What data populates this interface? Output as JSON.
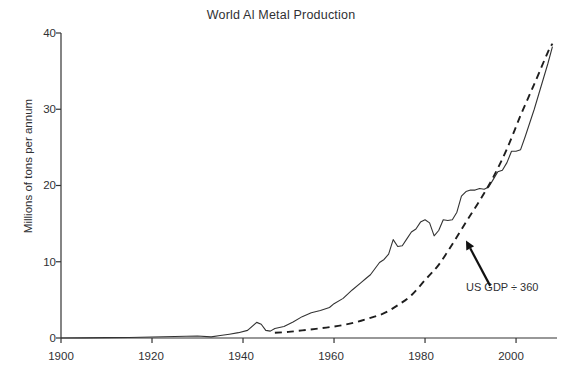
{
  "chart_data": {
    "type": "line",
    "title": "World Al Metal Production",
    "xlabel": "",
    "ylabel": "Millions of tons per annum",
    "xlim": [
      1900,
      2009
    ],
    "ylim": [
      0,
      40
    ],
    "xticks": [
      1900,
      1920,
      1940,
      1960,
      1980,
      2000
    ],
    "xtick_labels": [
      "1900",
      "1920",
      "1940",
      "1960",
      "1980",
      "2000"
    ],
    "yticks": [
      0,
      10,
      20,
      30,
      40
    ],
    "ytick_labels": [
      "0",
      "10",
      "20",
      "30",
      "40"
    ],
    "grid": false,
    "legend": "none",
    "annotations": [
      {
        "text": "US GDP ÷ 360",
        "points_to_series": "US GDP ÷ 360",
        "arrow_tip_year": 1989,
        "arrow_tip_value": 12.8,
        "label_year": 1993,
        "label_value": 7.1
      }
    ],
    "series": [
      {
        "name": "World Al metal production",
        "style": "solid",
        "color": "#333333",
        "x": [
          1900,
          1905,
          1910,
          1915,
          1920,
          1925,
          1930,
          1933,
          1935,
          1937,
          1939,
          1941,
          1943,
          1944,
          1945,
          1946,
          1947,
          1949,
          1951,
          1953,
          1955,
          1957,
          1959,
          1960,
          1962,
          1964,
          1966,
          1967,
          1968,
          1970,
          1971,
          1972,
          1973,
          1974,
          1975,
          1976,
          1977,
          1978,
          1979,
          1980,
          1981,
          1982,
          1983,
          1984,
          1985,
          1986,
          1987,
          1988,
          1989,
          1990,
          1991,
          1992,
          1993,
          1994,
          1995,
          1996,
          1997,
          1998,
          1999,
          2000,
          2001,
          2002,
          2003,
          2004,
          2005,
          2006,
          2007,
          2008
        ],
        "y": [
          0.007,
          0.01,
          0.045,
          0.07,
          0.13,
          0.19,
          0.27,
          0.15,
          0.32,
          0.5,
          0.7,
          1.0,
          2.05,
          1.8,
          1.0,
          0.9,
          1.25,
          1.5,
          2.1,
          2.8,
          3.3,
          3.6,
          4.0,
          4.5,
          5.2,
          6.3,
          7.3,
          7.8,
          8.3,
          9.9,
          10.3,
          11.0,
          12.9,
          12.0,
          12.1,
          13.0,
          13.9,
          14.3,
          15.2,
          15.5,
          15.1,
          13.4,
          14.1,
          15.5,
          15.4,
          15.5,
          16.5,
          18.6,
          19.2,
          19.4,
          19.4,
          19.6,
          19.5,
          19.8,
          20.8,
          21.8,
          22.0,
          23.0,
          24.5,
          24.5,
          24.7,
          26.4,
          28.2,
          30.0,
          32.0,
          34.0,
          36.0,
          38.2
        ]
      },
      {
        "name": "US GDP ÷ 360",
        "style": "dashed",
        "color": "#1e1e1e",
        "x": [
          1947,
          1950,
          1953,
          1956,
          1959,
          1962,
          1965,
          1968,
          1971,
          1974,
          1977,
          1980,
          1983,
          1986,
          1989,
          1992,
          1995,
          1998,
          2001,
          2004,
          2007,
          2008
        ],
        "y": [
          0.68,
          0.8,
          1.0,
          1.2,
          1.42,
          1.7,
          2.1,
          2.65,
          3.25,
          4.3,
          5.6,
          7.6,
          9.6,
          12.3,
          15.2,
          18.0,
          21.1,
          24.8,
          29.2,
          33.3,
          37.5,
          38.6
        ]
      }
    ]
  },
  "caption": {
    "text": ""
  }
}
